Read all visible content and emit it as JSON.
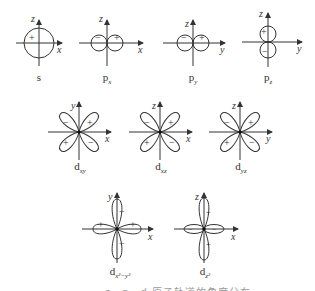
{
  "figure": {
    "stroke_color": "#333333",
    "orbitals": [
      {
        "id": "s",
        "label": "s",
        "sub": "",
        "axes": [
          "z",
          "x"
        ],
        "signs": [
          "+"
        ]
      },
      {
        "id": "px",
        "label": "p",
        "sub": "x",
        "axes": [
          "z",
          "x"
        ],
        "signs": [
          "−",
          "+"
        ]
      },
      {
        "id": "py",
        "label": "p",
        "sub": "y",
        "axes": [
          "z",
          "y"
        ],
        "signs": [
          "−",
          "+"
        ]
      },
      {
        "id": "pz",
        "label": "p",
        "sub": "z",
        "axes": [
          "z",
          "y"
        ],
        "signs": [
          "+",
          "−"
        ]
      },
      {
        "id": "dxy",
        "label": "d",
        "sub": "xy",
        "axes": [
          "y",
          "x"
        ],
        "signs": [
          "−",
          "+",
          "+",
          "−"
        ]
      },
      {
        "id": "dxz",
        "label": "d",
        "sub": "xz",
        "axes": [
          "z",
          "x"
        ],
        "signs": [
          "−",
          "+",
          "+",
          "−"
        ]
      },
      {
        "id": "dyz",
        "label": "d",
        "sub": "yz",
        "axes": [
          "z",
          "y"
        ],
        "signs": [
          "−",
          "+",
          "+",
          "−"
        ]
      },
      {
        "id": "dx2y2",
        "label": "d",
        "sub": "x²−y²",
        "axes": [
          "y",
          "x"
        ],
        "signs": [
          "−",
          "+",
          "+",
          "−"
        ]
      },
      {
        "id": "dz2",
        "label": "d",
        "sub": "z²",
        "axes": [
          "z",
          "x"
        ],
        "signs": [
          "+",
          "−",
          "−",
          "+"
        ]
      }
    ],
    "caption": "s、p、d 原子轨道的角度分布图"
  }
}
